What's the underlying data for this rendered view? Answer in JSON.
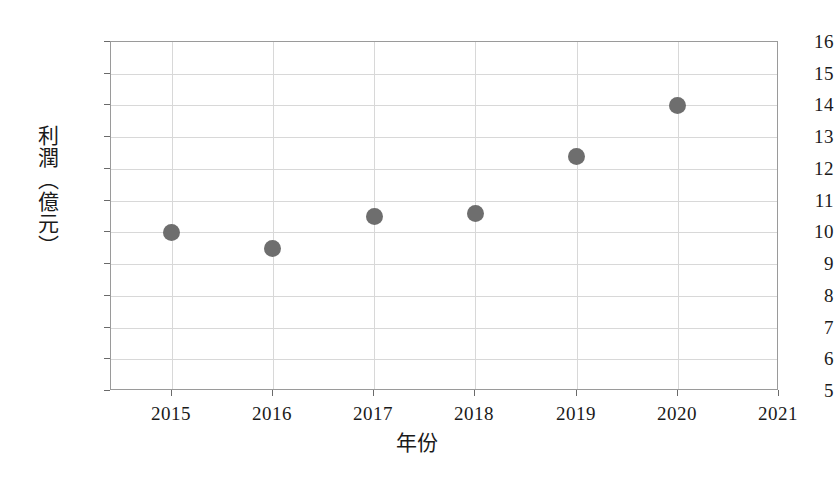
{
  "chart_data": {
    "type": "scatter",
    "title": "",
    "xlabel": "年份",
    "ylabel": "利潤（億元）",
    "x": [
      2015,
      2016,
      2017,
      2018,
      2019,
      2020
    ],
    "values": [
      10.0,
      9.5,
      10.5,
      10.6,
      12.4,
      14.0
    ],
    "series": [
      {
        "name": "利潤",
        "points": [
          {
            "x": 2015,
            "y": 10.0
          },
          {
            "x": 2016,
            "y": 9.5
          },
          {
            "x": 2017,
            "y": 10.5
          },
          {
            "x": 2018,
            "y": 10.6
          },
          {
            "x": 2019,
            "y": 12.4
          },
          {
            "x": 2020,
            "y": 14.0
          }
        ]
      }
    ],
    "xlim": [
      2014.4,
      2021.0
    ],
    "ylim": [
      5,
      16
    ],
    "xticks": [
      2015,
      2016,
      2017,
      2018,
      2019,
      2020,
      2021
    ],
    "xtick_labels": [
      "2015",
      "2016",
      "2017",
      "2018",
      "2019",
      "2020",
      "2021"
    ],
    "yticks": [
      5,
      6,
      7,
      8,
      9,
      10,
      11,
      12,
      13,
      14,
      15,
      16
    ],
    "ytick_labels": [
      "5",
      "6",
      "7",
      "8",
      "9",
      "10",
      "11",
      "12",
      "13",
      "14",
      "15",
      "16"
    ],
    "grid": true,
    "grid_axis": "both",
    "legend": false,
    "legend_position": "none",
    "marker_color": "#6e6e6e",
    "grid_color": "#d8d8d8",
    "frame_color": "#9a9a9a",
    "background_color": "#ffffff",
    "marker_shape": "circle"
  }
}
